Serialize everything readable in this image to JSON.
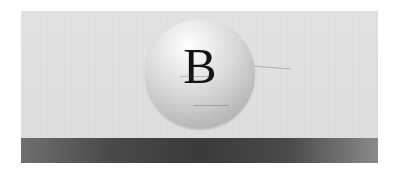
{
  "banner": {
    "ball_letter": "B",
    "colors": {
      "panel": "#e1e1e1",
      "ball_highlight": "#ffffff",
      "ball_shadow": "#a6a6a6",
      "letter": "#141414",
      "band_dark": "#3a3a3a",
      "band_light": "#8a8a8a"
    }
  }
}
